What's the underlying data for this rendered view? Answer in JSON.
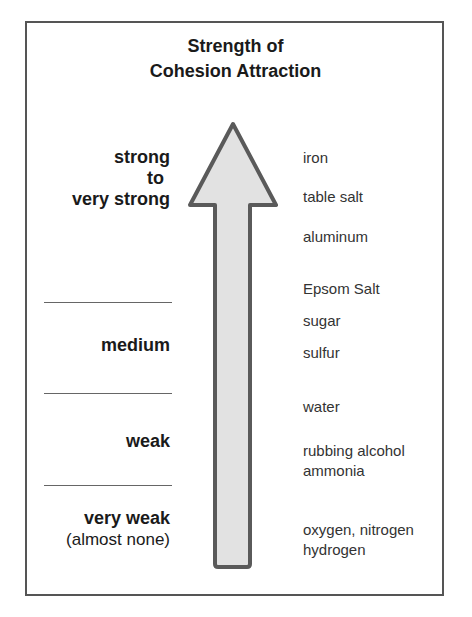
{
  "title": {
    "line1": "Strength of",
    "line2": "Cohesion Attraction"
  },
  "levels": [
    {
      "label": "strong",
      "label2": "to",
      "label3": "very strong"
    },
    {
      "label": "medium"
    },
    {
      "label": "weak"
    },
    {
      "label": "very weak",
      "sub": "(almost none)"
    }
  ],
  "substances": [
    "iron",
    "table salt",
    "aluminum",
    "Epsom Salt",
    "sugar",
    "sulfur",
    "water",
    "rubbing alcohol",
    "ammonia",
    "oxygen, nitrogen",
    "hydrogen"
  ],
  "colors": {
    "arrow_fill": "#e2e2e2",
    "arrow_stroke": "#5a5a5a",
    "frame": "#555555"
  },
  "arrow": {
    "direction": "up",
    "meaning": "increasing strength of cohesion attraction"
  }
}
